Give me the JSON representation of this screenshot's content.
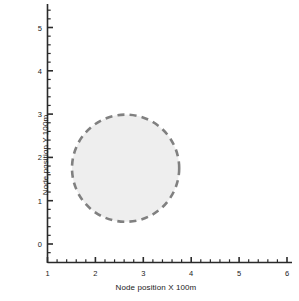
{
  "chart_data": {
    "type": "scatter",
    "title": "",
    "xlabel": "Node position X 100m",
    "ylabel": "Node position Y 100m",
    "xlim": [
      1,
      6
    ],
    "ylim": [
      -0.3,
      5.5
    ],
    "xticks": [
      1,
      2,
      3,
      4,
      5,
      6
    ],
    "yticks": [
      0,
      1,
      2,
      3,
      4,
      5
    ],
    "xtick_labels": [
      "1",
      "2",
      "3",
      "4",
      "5",
      "6"
    ],
    "ytick_labels": [
      "0",
      "1",
      "2",
      "3",
      "4",
      "5"
    ],
    "minor_tick_interval": 0.2,
    "grid": false,
    "legend": null,
    "annotations": [],
    "series": [
      {
        "name": "coverage-region",
        "type": "circle",
        "center_x": 2.63,
        "center_y": 1.75,
        "radius": 1.12,
        "fill_color": "#eeeeee",
        "edge_color": "#808080",
        "edge_style": "dashed",
        "edge_width": 2.5
      }
    ]
  },
  "axes": {
    "x_title": "Node position X 100m",
    "y_title": "Node position Y 100m"
  },
  "caption": {
    "bottom_partial": ""
  }
}
